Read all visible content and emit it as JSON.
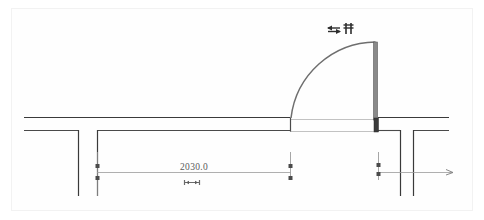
{
  "drawing": {
    "type": "architectural-floor-plan",
    "title": "Door opening plan detail",
    "background_color": "#ffffff",
    "frame_color": "#f2f2f2",
    "line_color_dark": "#3a3a3a",
    "line_color_medium": "#6e6e6e",
    "line_color_light": "#b8b8b8",
    "dim_line_color": "#8f8f8f",
    "door_jamb_fill": "#4a4a4a"
  },
  "dimension": {
    "value_label": "2030.0",
    "text_color": "#5a5a5a",
    "start_marker": "tick",
    "end_marker": "tick",
    "extension_marker": "arrow"
  },
  "annotations": {
    "symbol_group_label": "door-swing-markers",
    "symbol_count": 2
  },
  "elements": {
    "wall_upper_label": "upper-wall",
    "wall_lower_left_label": "lower-wall-left",
    "wall_lower_right_label": "lower-wall-right",
    "door_arc_label": "door-swing-arc",
    "door_leaf_label": "door-leaf",
    "cross_wall_left_label": "cross-wall-left",
    "cross_wall_right_label": "cross-wall-right",
    "cross_wall_far_right_label": "cross-wall-far-right"
  }
}
